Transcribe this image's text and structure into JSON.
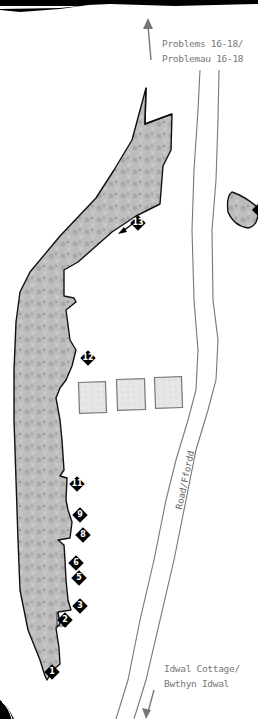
{
  "map": {
    "north_label": {
      "line1": "Problems 16-18/",
      "line2": "Problemau 16-18"
    },
    "south_label": {
      "line1": "Idwal Cottage/",
      "line2": "Bwthyn Idwal"
    },
    "road_label": "Road/Ffordd",
    "colors": {
      "rock": "#b8b8b8",
      "outline": "#111111",
      "road": "#777777",
      "marker": "#000000",
      "label": "#777777"
    },
    "markers": [
      {
        "id": "1",
        "label": "1",
        "x": 52,
        "y": 672
      },
      {
        "id": "2",
        "label": "2",
        "x": 60,
        "y": 620
      },
      {
        "id": "3",
        "label": "3",
        "x": 73,
        "y": 599
      },
      {
        "id": "5",
        "label": "5",
        "x": 72,
        "y": 571
      },
      {
        "id": "6",
        "label": "6",
        "x": 70,
        "y": 556
      },
      {
        "id": "8",
        "label": "8",
        "x": 76,
        "y": 528
      },
      {
        "id": "9",
        "label": "9",
        "x": 73,
        "y": 509
      },
      {
        "id": "11",
        "label": "11",
        "x": 70,
        "y": 478
      },
      {
        "id": "12",
        "label": "12",
        "x": 81,
        "y": 351
      },
      {
        "id": "13",
        "label": "13",
        "x": 131,
        "y": 216
      }
    ],
    "buildings_count": 3
  }
}
